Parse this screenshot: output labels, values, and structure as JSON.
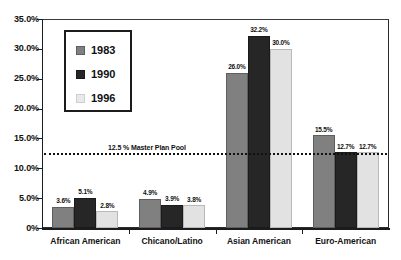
{
  "chart_data": {
    "type": "bar",
    "title": "",
    "xlabel": "",
    "ylabel": "",
    "categories": [
      "African American",
      "Chicano/Latino",
      "Asian American",
      "Euro-American"
    ],
    "series": [
      {
        "name": "1983",
        "color": "#808080",
        "values": [
          3.6,
          4.9,
          26.0,
          15.5
        ],
        "labels": [
          "3.6%",
          "4.9%",
          "26.0%",
          "15.5%"
        ]
      },
      {
        "name": "1990",
        "color": "#262626",
        "values": [
          5.1,
          3.9,
          32.2,
          12.7
        ],
        "labels": [
          "5.1%",
          "3.9%",
          "32.2%",
          "12.7%"
        ]
      },
      {
        "name": "1996",
        "color": "#e2e2e2",
        "values": [
          2.8,
          3.8,
          30.0,
          12.7
        ],
        "labels": [
          "2.8%",
          "3.8%",
          "30.0%",
          "12.7%"
        ]
      }
    ],
    "ylim": [
      0,
      35
    ],
    "ytick_values": [
      0,
      5,
      10,
      15,
      20,
      25,
      30,
      35
    ],
    "ytick_labels": [
      "0%",
      "5.0%",
      "10.0%",
      "15.0%",
      "20.0%",
      "25.0%",
      "30.0%",
      "35.0%"
    ],
    "grid": false,
    "legend_position": "upper-left-inside",
    "annotations": [
      {
        "name": "master-plan-pool",
        "text": "12.5 % Master Plan Pool",
        "value": 12.5,
        "style": "dotted-horizontal-line"
      }
    ]
  },
  "legend": {
    "entries": [
      {
        "label": "1983"
      },
      {
        "label": "1990"
      },
      {
        "label": "1996"
      }
    ]
  }
}
